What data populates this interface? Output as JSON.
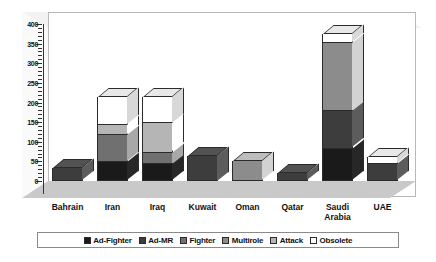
{
  "chart_data": {
    "type": "bar",
    "subtype": "stacked-3d-column",
    "title": "",
    "subtitle": "",
    "xlabel": "",
    "ylabel": "",
    "ylim": [
      0,
      400
    ],
    "y_ticks": [
      0,
      50,
      100,
      150,
      200,
      250,
      300,
      350,
      400
    ],
    "y_tick_labels": [
      "0",
      "50",
      "100",
      "150",
      "200",
      "250",
      "300",
      "350",
      "400"
    ],
    "y_minor_tick_step": 10,
    "grid": false,
    "legend_position": "bottom",
    "categories": [
      "Bahrain",
      "Iran",
      "Iraq",
      "Kuwait",
      "Oman",
      "Qatar",
      "Saudi Arabia",
      "UAE"
    ],
    "category_labels": [
      [
        "Bahrain"
      ],
      [
        "Iran"
      ],
      [
        "Iraq"
      ],
      [
        "Kuwait"
      ],
      [
        "Oman"
      ],
      [
        "Qatar"
      ],
      [
        "Saudi",
        "Arabia"
      ],
      [
        "UAE"
      ]
    ],
    "series": [
      {
        "name": "Ad-Fighter",
        "color": "#1a1a1a",
        "values": [
          0,
          50,
          45,
          0,
          0,
          0,
          85,
          0
        ]
      },
      {
        "name": "Ad-MR",
        "color": "#3d3d3d",
        "values": [
          34,
          0,
          0,
          65,
          0,
          20,
          95,
          45
        ]
      },
      {
        "name": "Fighter",
        "color": "#707070",
        "values": [
          0,
          70,
          30,
          0,
          0,
          0,
          0,
          0
        ]
      },
      {
        "name": "Multirole",
        "color": "#8c8c8c",
        "values": [
          0,
          0,
          0,
          0,
          50,
          0,
          175,
          0
        ]
      },
      {
        "name": "Attack",
        "color": "#b5b5b5",
        "values": [
          0,
          25,
          75,
          0,
          0,
          0,
          0,
          0
        ]
      },
      {
        "name": "Obsolete",
        "color": "#ffffff",
        "values": [
          0,
          70,
          65,
          0,
          0,
          0,
          20,
          15
        ]
      }
    ],
    "totals": [
      34,
      215,
      215,
      65,
      50,
      20,
      375,
      60
    ]
  },
  "legend": {
    "items": [
      {
        "label": "Ad-Fighter",
        "color": "#1a1a1a"
      },
      {
        "label": "Ad-MR",
        "color": "#3d3d3d"
      },
      {
        "label": "Fighter",
        "color": "#707070"
      },
      {
        "label": "Multirole",
        "color": "#8c8c8c"
      },
      {
        "label": "Attack",
        "color": "#b5b5b5"
      },
      {
        "label": "Obsolete",
        "color": "#ffffff"
      }
    ]
  },
  "style": {
    "plot_background": "#ffffff",
    "floor_color": "#c9c9c9",
    "ceiling_color": "#f2f2f2",
    "wall_border": "#b8b8b8",
    "axis_color": "#333333",
    "outline_color": "#2b2b2b"
  }
}
